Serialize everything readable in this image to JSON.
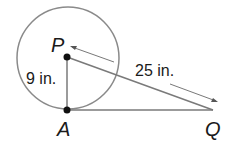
{
  "diagram": {
    "points": {
      "P": "P",
      "A": "A",
      "Q": "Q"
    },
    "measures": {
      "PA": "9 in.",
      "PQ": "25 in."
    },
    "colors": {
      "circle": "#8a8a8a",
      "segment": "#7a7a7a",
      "point": "#111111",
      "arrow": "#555555"
    }
  }
}
